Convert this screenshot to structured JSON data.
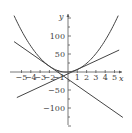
{
  "chart_data": {
    "type": "line",
    "title": "",
    "xlabel": "x",
    "ylabel": "y",
    "xlim": [
      -6,
      6
    ],
    "ylim": [
      -150,
      160
    ],
    "x_ticks": [
      -5,
      -4,
      -3,
      -2,
      -1,
      1,
      2,
      3,
      4,
      5
    ],
    "x_tick_labels": [
      "−5",
      "−4",
      "−3",
      "−2",
      "−1",
      "1",
      "2",
      "3",
      "4",
      "5"
    ],
    "y_ticks": [
      100,
      50,
      -50,
      -100
    ],
    "y_tick_labels": [
      "100",
      "50",
      "−50",
      "−100"
    ],
    "grid": false,
    "legend": null,
    "series": [
      {
        "name": "parabola",
        "formula": "y = 5x^2 + 2x",
        "x": [
          -5.8,
          -4,
          -2,
          -1,
          -0.2,
          0,
          1,
          2,
          4,
          5.4
        ],
        "y": [
          156.6,
          72,
          16,
          3,
          -0.2,
          0,
          7,
          24,
          88,
          156.6
        ]
      },
      {
        "name": "tangent line at x=1",
        "formula": "y = 12x - 5",
        "x": [
          -5.5,
          5.5
        ],
        "y": [
          -71,
          61
        ]
      },
      {
        "name": "tangent line at x=-2",
        "formula": "y = -18x - 20",
        "x": [
          -5.8,
          5.9
        ],
        "y": [
          84.4,
          -126.2
        ]
      }
    ]
  },
  "axes": {
    "x_label": "x",
    "y_label": "y"
  }
}
